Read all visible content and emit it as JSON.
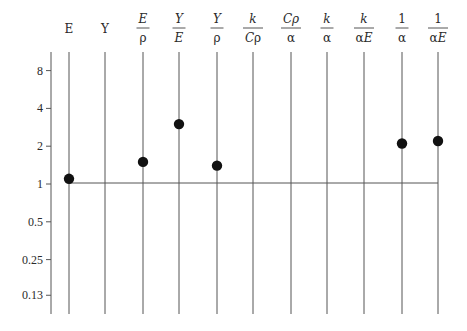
{
  "chart_data": {
    "type": "scatter",
    "title": "",
    "xlabel": "",
    "ylabel": "",
    "y_scale": "log2",
    "ylim": [
      0.11,
      10
    ],
    "grid": "vertical lines per category",
    "baseline_value": 1,
    "categories": [
      {
        "key": "E",
        "num": "E",
        "den": ""
      },
      {
        "key": "Y",
        "num": "Y",
        "den": ""
      },
      {
        "key": "E/rho",
        "num": "E",
        "den": "ρ"
      },
      {
        "key": "Y/E",
        "num": "Y",
        "den": "E"
      },
      {
        "key": "Y/rho",
        "num": "Y",
        "den": "ρ"
      },
      {
        "key": "k/(C rho)",
        "num": "k",
        "den": "Cρ"
      },
      {
        "key": "C rho/alpha",
        "num": "Cρ",
        "den": "α"
      },
      {
        "key": "k/alpha",
        "num": "k",
        "den": "α"
      },
      {
        "key": "k/(alpha E)",
        "num": "k",
        "den": "αE"
      },
      {
        "key": "1/alpha",
        "num": "1",
        "den": "α"
      },
      {
        "key": "1/(alpha E)",
        "num": "1",
        "den": "αE"
      }
    ],
    "y_ticks": [
      {
        "label": "8",
        "value": 8
      },
      {
        "label": "4",
        "value": 4
      },
      {
        "label": "2",
        "value": 2
      },
      {
        "label": "1",
        "value": 1
      },
      {
        "label": "0.5",
        "value": 0.5
      },
      {
        "label": "0.25",
        "value": 0.25
      },
      {
        "label": "0.13",
        "value": 0.13
      }
    ],
    "series": [
      {
        "name": "ratio",
        "values": [
          1.1,
          null,
          1.5,
          3.0,
          1.4,
          null,
          null,
          null,
          null,
          2.1,
          2.2
        ]
      }
    ]
  },
  "colors": {
    "line": "#555555",
    "point": "#111111",
    "text": "#2a2a2a"
  }
}
